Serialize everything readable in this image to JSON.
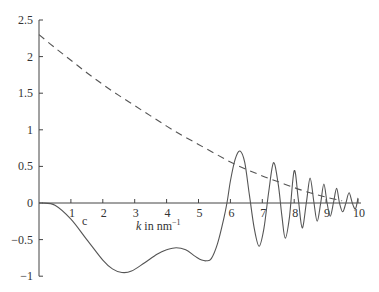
{
  "chart_data": {
    "type": "line",
    "title": "",
    "xlabel": "k in nm^-1",
    "xlabel_main": "k",
    "xlabel_rest": " in nm",
    "xlabel_sup": "−1",
    "ylabel": "",
    "xlim": [
      0,
      10
    ],
    "ylim": [
      -1,
      2.5
    ],
    "grid": false,
    "legend": "none",
    "annotations": [
      {
        "text": "c",
        "x": 1.35,
        "y": -0.3
      }
    ],
    "x_ticks": [
      1,
      2,
      3,
      4,
      5,
      6,
      7,
      8,
      9,
      10
    ],
    "x_tick_labels": [
      "1",
      "2",
      "3",
      "4",
      "5",
      "6",
      "7",
      "8",
      "9",
      "10"
    ],
    "y_ticks": [
      -1,
      -0.5,
      0,
      0.5,
      1,
      1.5,
      2,
      2.5
    ],
    "y_tick_labels": [
      "−1",
      "−0.5",
      "0",
      "0.5",
      "1",
      "1.5",
      "2",
      "2.5"
    ],
    "series": [
      {
        "name": "solid (c)",
        "style": "solid",
        "x": [
          0.1,
          0.5,
          1.0,
          1.5,
          2.0,
          2.3,
          2.6,
          2.9,
          3.3,
          3.7,
          4.0,
          4.3,
          4.6,
          4.9,
          5.1,
          5.25,
          5.4,
          5.6,
          5.8,
          5.9,
          6.0,
          6.15,
          6.3,
          6.45,
          6.6,
          6.75,
          6.9,
          7.05,
          7.2,
          7.35,
          7.5,
          7.62,
          7.72,
          7.85,
          8.0,
          8.13,
          8.25,
          8.38,
          8.5,
          8.62,
          8.72,
          8.83,
          8.93,
          9.03,
          9.13,
          9.23,
          9.33,
          9.42,
          9.52,
          9.62,
          9.72,
          9.82,
          9.92,
          10.0
        ],
        "values": [
          0.0,
          -0.03,
          -0.22,
          -0.5,
          -0.78,
          -0.9,
          -0.95,
          -0.93,
          -0.82,
          -0.7,
          -0.64,
          -0.61,
          -0.64,
          -0.73,
          -0.78,
          -0.79,
          -0.76,
          -0.55,
          -0.2,
          0.02,
          0.3,
          0.6,
          0.71,
          0.55,
          0.1,
          -0.35,
          -0.59,
          -0.35,
          0.15,
          0.55,
          0.25,
          -0.2,
          -0.48,
          -0.2,
          0.44,
          0.05,
          -0.34,
          0.0,
          0.34,
          0.0,
          -0.25,
          0.0,
          0.26,
          0.0,
          -0.18,
          0.0,
          0.2,
          0.0,
          -0.12,
          0.0,
          0.14,
          0.0,
          -0.08,
          0.07
        ]
      },
      {
        "name": "dashed",
        "style": "dashed",
        "x": [
          0,
          0.5,
          1.0,
          1.5,
          2.0,
          2.5,
          3.0,
          3.5,
          4.0,
          4.5,
          5.0,
          5.5,
          6.0,
          6.5,
          7.0,
          7.5,
          8.0,
          8.5,
          9.0,
          9.5
        ],
        "values": [
          2.3,
          2.12,
          1.95,
          1.78,
          1.62,
          1.47,
          1.33,
          1.19,
          1.05,
          0.92,
          0.8,
          0.68,
          0.56,
          0.46,
          0.37,
          0.29,
          0.21,
          0.14,
          0.08,
          0.03
        ]
      }
    ]
  }
}
